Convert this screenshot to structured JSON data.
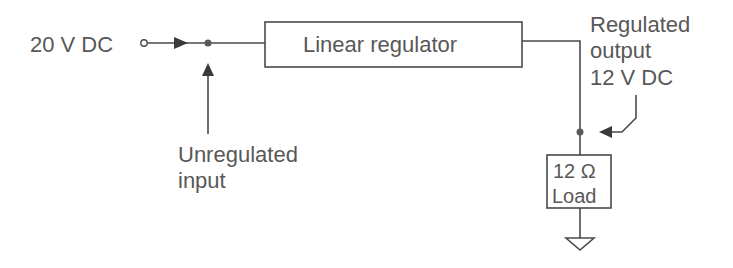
{
  "diagram": {
    "type": "block-diagram",
    "input": {
      "label": "20 V DC"
    },
    "regulator": {
      "label": "Linear regulator"
    },
    "annotations": {
      "unregulated_input": {
        "line1": "Unregulated",
        "line2": "input"
      },
      "regulated_output": {
        "line1": "Regulated",
        "line2": "output",
        "line3": "12 V DC"
      }
    },
    "load": {
      "line1": "12 Ω",
      "line2": "Load"
    },
    "ground": {
      "symbol": "ground-icon"
    },
    "colors": {
      "text": "#585858",
      "line": "#4a4a4a",
      "background": "#ffffff"
    }
  }
}
